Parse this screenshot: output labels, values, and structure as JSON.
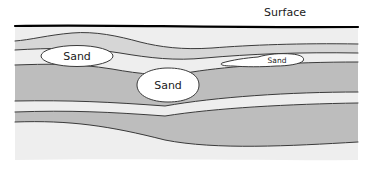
{
  "figure": {
    "kind": "geologic-cross-section",
    "background_color": "#ffffff"
  },
  "labels": {
    "surface": "Surface",
    "sand_left": "Sand",
    "sand_center": "Sand",
    "sand_right": "Sand"
  },
  "colors": {
    "light_layer": "#eeeeee",
    "mid_layer": "#d6d6d6",
    "dark_layer": "#bdbdbd",
    "lens_fill": "#ffffff",
    "line": "#3a3a3a",
    "surface_line": "#000000",
    "text": "#1a1a1a"
  },
  "layers": [
    {
      "name": "upper-light-silt",
      "tone": "light"
    },
    {
      "name": "upper-gray-clay",
      "tone": "mid"
    },
    {
      "name": "middle-light-silt",
      "tone": "light"
    },
    {
      "name": "middle-dark-clay",
      "tone": "dark"
    },
    {
      "name": "lower-light-silt",
      "tone": "light"
    },
    {
      "name": "lower-dark-clay",
      "tone": "dark"
    },
    {
      "name": "basal-light-silt",
      "tone": "light"
    }
  ],
  "sand_bodies": [
    {
      "name": "sand-lens-left",
      "label": "Sand",
      "font_size": 11
    },
    {
      "name": "sand-lens-center",
      "label": "Sand",
      "font_size": 11
    },
    {
      "name": "sand-lens-right",
      "label": "Sand",
      "font_size": 7.5
    }
  ],
  "surface_label_position": {
    "x": 285,
    "y": 12,
    "font_size": 11
  }
}
